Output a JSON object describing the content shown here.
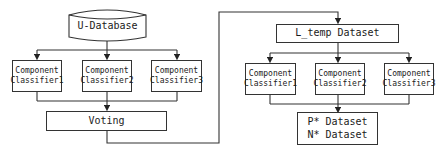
{
  "diagram": {
    "left": {
      "database": "U-Database",
      "classifiers": [
        {
          "line1": "Component",
          "line2": "Classifier1"
        },
        {
          "line1": "Component",
          "line2": "Classifier2"
        },
        {
          "line1": "Component",
          "line2": "Classifier3"
        }
      ],
      "voting": "Voting"
    },
    "right": {
      "dataset": "L_temp Dataset",
      "classifiers": [
        {
          "line1": "Component",
          "line2": "Classifier1"
        },
        {
          "line1": "Component",
          "line2": "Classifier2"
        },
        {
          "line1": "Component",
          "line2": "Classifier3"
        }
      ],
      "output": {
        "line1": "P* Dataset",
        "line2": "N* Dataset"
      }
    }
  }
}
